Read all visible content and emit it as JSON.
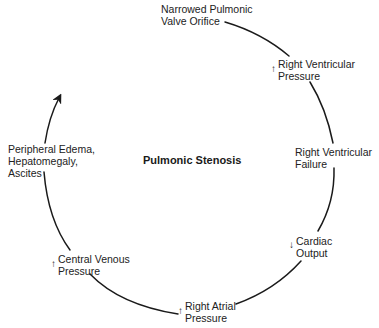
{
  "diagram": {
    "title": "Pulmonic Stenosis",
    "type": "cycle",
    "direction": "clockwise",
    "nodes": [
      {
        "id": "narrowed-valve",
        "lines": [
          "Narrowed Pulmonic",
          "Valve Orifice"
        ],
        "indicator": ""
      },
      {
        "id": "rv-pressure",
        "lines": [
          "Right Ventricular",
          "Pressure"
        ],
        "indicator": "↑"
      },
      {
        "id": "rv-failure",
        "lines": [
          "Right Ventricular",
          "Failure"
        ],
        "indicator": ""
      },
      {
        "id": "cardiac-output",
        "lines": [
          "Cardiac",
          "Output"
        ],
        "indicator": "↓"
      },
      {
        "id": "ra-pressure",
        "lines": [
          "Right Atrial",
          "Pressure"
        ],
        "indicator": "↑"
      },
      {
        "id": "cvp",
        "lines": [
          "Central Venous",
          "Pressure"
        ],
        "indicator": "↑"
      },
      {
        "id": "edema",
        "lines": [
          "Peripheral Edema,",
          "Hepatomegaly,",
          "Ascites"
        ],
        "indicator": ""
      }
    ],
    "edges": [
      {
        "from": "narrowed-valve",
        "to": "rv-pressure"
      },
      {
        "from": "rv-pressure",
        "to": "rv-failure"
      },
      {
        "from": "rv-failure",
        "to": "cardiac-output"
      },
      {
        "from": "cardiac-output",
        "to": "ra-pressure"
      },
      {
        "from": "ra-pressure",
        "to": "cvp"
      },
      {
        "from": "cvp",
        "to": "edema"
      },
      {
        "from": "edema",
        "to": "narrowed-valve",
        "arrowhead": true,
        "open_ended": true
      }
    ],
    "colors": {
      "line": "#1a1a1a",
      "text": "#222222",
      "background": "#ffffff"
    }
  }
}
